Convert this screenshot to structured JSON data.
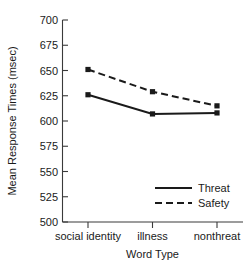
{
  "chart_data": {
    "type": "line",
    "title": "",
    "xlabel": "Word Type",
    "ylabel": "Mean Response Times (msec)",
    "categories": [
      "social identity",
      "illness",
      "nonthreat"
    ],
    "series": [
      {
        "name": "Threat",
        "values": [
          626,
          607,
          608
        ],
        "style": "solid",
        "color": "#1a1a1a",
        "marker": "square"
      },
      {
        "name": "Safety",
        "values": [
          651,
          629,
          615
        ],
        "style": "dashed",
        "color": "#1a1a1a",
        "marker": "square"
      }
    ],
    "ylim": [
      500,
      700
    ],
    "yticks": [
      500,
      525,
      550,
      575,
      600,
      625,
      650,
      675,
      700
    ],
    "ytick_labels": [
      "500",
      "525",
      "550",
      "575",
      "600",
      "625",
      "650",
      "675",
      "700"
    ],
    "grid": false,
    "legend_position": "lower-right-inside"
  },
  "axes": {
    "y_title": "Mean Response Times (msec)",
    "x_title": "Word Type",
    "y_ticks": [
      "700",
      "675",
      "650",
      "625",
      "600",
      "575",
      "550",
      "525",
      "500"
    ],
    "x_ticks": [
      "social identity",
      "illness",
      "nonthreat"
    ]
  },
  "legend": {
    "entries": [
      {
        "label": "Threat",
        "style": "solid"
      },
      {
        "label": "Safety",
        "style": "dashed"
      }
    ]
  }
}
